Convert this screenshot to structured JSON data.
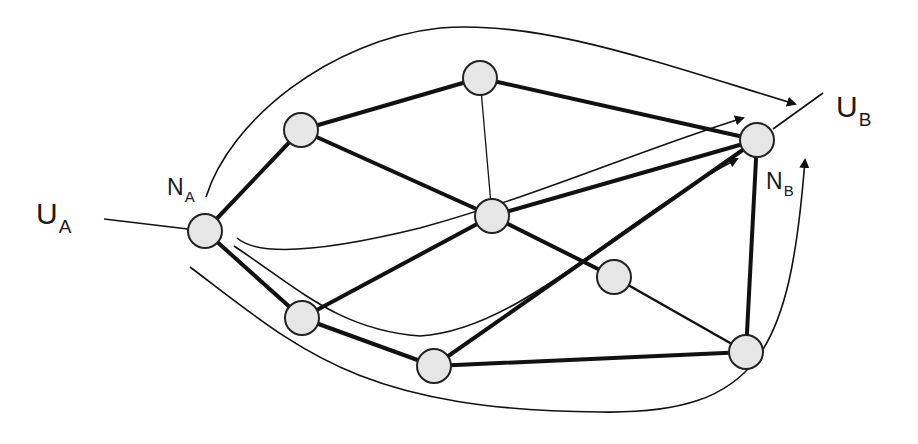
{
  "labels": {
    "ua": {
      "main": "U",
      "sub": "A"
    },
    "ub": {
      "main": "U",
      "sub": "B"
    },
    "na": {
      "main": "N",
      "sub": "A"
    },
    "nb": {
      "main": "N",
      "sub": "B"
    }
  },
  "colors": {
    "node_fill": "#e6e6e6",
    "stroke": "#111111",
    "background": "#ffffff"
  },
  "nodes": [
    {
      "id": "NA",
      "x": 205,
      "y": 231
    },
    {
      "id": "n1",
      "x": 301,
      "y": 130
    },
    {
      "id": "n2",
      "x": 480,
      "y": 78
    },
    {
      "id": "n3",
      "x": 492,
      "y": 216
    },
    {
      "id": "n4",
      "x": 302,
      "y": 318
    },
    {
      "id": "n5",
      "x": 434,
      "y": 366
    },
    {
      "id": "n6",
      "x": 614,
      "y": 277
    },
    {
      "id": "n7",
      "x": 746,
      "y": 352
    },
    {
      "id": "NB",
      "x": 757,
      "y": 140
    }
  ]
}
